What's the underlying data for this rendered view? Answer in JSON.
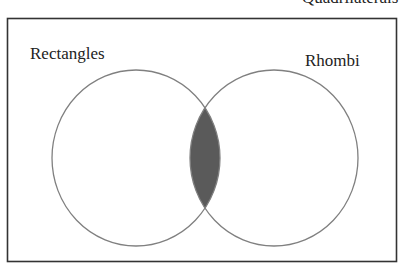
{
  "diagram": {
    "type": "venn",
    "universe_label": "Quadrilaterals",
    "sets": [
      {
        "label": "Rectangles",
        "position": "left"
      },
      {
        "label": "Rhombi",
        "position": "right"
      }
    ],
    "shaded_region": "Rectangles ∩ Rhombi",
    "colors": {
      "border": "#333333",
      "circle_stroke": "#808080",
      "shade": "#5a5a5a",
      "background": "#ffffff"
    }
  }
}
